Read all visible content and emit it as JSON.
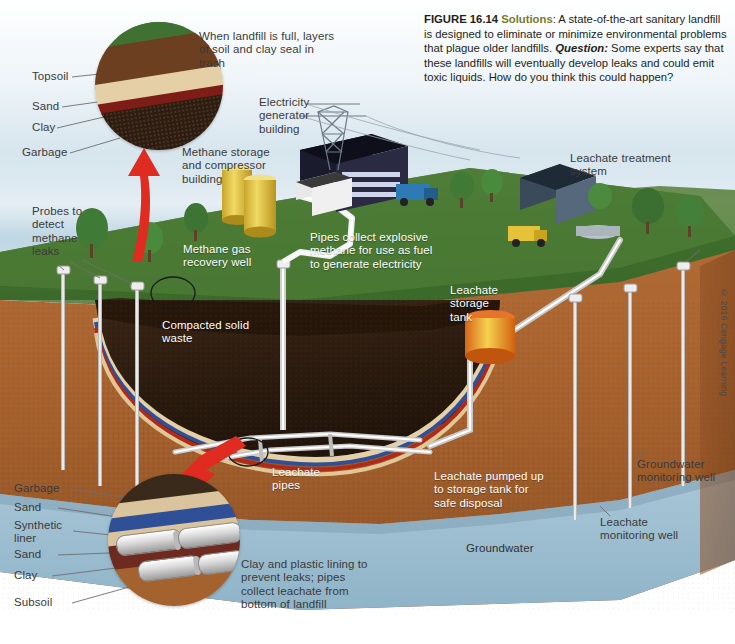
{
  "figure": {
    "number": "FIGURE 16.14",
    "solutions_label": "Solutions",
    "caption_body": ": A state-of-the-art sanitary landfill is designed to eliminate or minimize environmental problems that plague older landfills. ",
    "question_label": "Question:",
    "question_body": " Some experts say that these landfills will eventually develop leaks and could emit toxic liquids. How do you think this could happen?",
    "copyright": "© 2016 Cengage Learning"
  },
  "top_inset": {
    "caption": "When landfill is full, layers of soil and clay seal in trash",
    "layers": [
      {
        "name": "Topsoil"
      },
      {
        "name": "Sand"
      },
      {
        "name": "Clay"
      },
      {
        "name": "Garbage"
      }
    ]
  },
  "bottom_inset": {
    "caption": "Clay and plastic lining to prevent leaks; pipes collect leachate from bottom of landfill",
    "layers": [
      {
        "name": "Garbage"
      },
      {
        "name": "Sand"
      },
      {
        "name": "Synthetic liner"
      },
      {
        "name": "Sand"
      },
      {
        "name": "Clay"
      },
      {
        "name": "Subsoil"
      }
    ]
  },
  "annotations": {
    "probes": "Probes to detect methane leaks",
    "methane_storage": "Methane storage and compressor building",
    "electricity_building": "Electricity generator building",
    "methane_well": "Methane gas recovery well",
    "pipes_collect": "Pipes collect explosive methane for use as fuel to generate electricity",
    "leachate_treatment": "Leachate treatment system",
    "leachate_tank": "Leachate storage tank",
    "compacted_waste": "Compacted solid waste",
    "leachate_pipes": "Leachate pipes",
    "leachate_pumped": "Leachate pumped up to storage tank for safe disposal",
    "groundwater": "Groundwater",
    "groundwater_well": "Groundwater monitoring well",
    "leachate_well": "Leachate monitoring well"
  },
  "colors": {
    "topsoil": "#6d3f21",
    "sand": "#e4cfa6",
    "clay": "#7d1d16",
    "garbage": "#2e1c0f",
    "synthetic_liner": "#2f4f96",
    "subsoil": "#a4622f",
    "groundwater": "#9cbdd0",
    "grass": "#3f7232",
    "arrow_red": "#e02b20",
    "tank_yellow": "#e8c83c",
    "solutions_olive": "#7a7a2b"
  }
}
